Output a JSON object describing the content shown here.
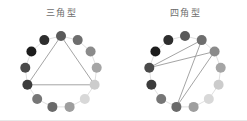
{
  "figure": {
    "background_color": "#ffffff",
    "width": 247,
    "height": 121,
    "bottom_rule_color": "#e8e8e8"
  },
  "panels": [
    {
      "id": "triangle",
      "title": "三角型",
      "title_color": "#6d6d6d"
    },
    {
      "id": "quadrilateral",
      "title": "四角型",
      "title_color": "#6d6d6d"
    }
  ],
  "chart_data": {
    "type": "scatter",
    "title": "",
    "xlabel": "",
    "ylabel": "",
    "grid": false,
    "legend": false,
    "ring_node_count": 13,
    "ring_outline_color": "#e0e0e0",
    "polygon_line_color": "#9a9a9a",
    "node_radius_px": 5.0,
    "ring_radius_px": 36,
    "node_gray_values": [
      "#2c2c2c",
      "#1e1e1e",
      "#3a3a3a",
      "#454545",
      "#4f4f4f",
      "#5c5c5c",
      "#6b6b6b",
      "#7d7d7d",
      "#9a9a9a",
      "#b5b5b5",
      "#cfcfcf",
      "#dcdcdc",
      "#8a8a8a"
    ],
    "panels": [
      {
        "name": "三角型",
        "center": [
          61,
          50
        ],
        "nodes": [
          {
            "index": 0,
            "angle_deg": 90,
            "x": 61.0,
            "y": 14.0,
            "color": "#5a5a5a"
          },
          {
            "index": 1,
            "angle_deg": 62.3,
            "x": 77.7,
            "y": 18.1,
            "color": "#6e6e6e"
          },
          {
            "index": 2,
            "angle_deg": 34.6,
            "x": 90.6,
            "y": 29.5,
            "color": "#8b8b8b"
          },
          {
            "index": 3,
            "angle_deg": 6.9,
            "x": 96.7,
            "y": 45.7,
            "color": "#a5a5a5"
          },
          {
            "index": 4,
            "angle_deg": -20.8,
            "x": 94.6,
            "y": 62.8,
            "color": "#cccccc"
          },
          {
            "index": 5,
            "angle_deg": -48.5,
            "x": 84.8,
            "y": 77.0,
            "color": "#d8d8d8"
          },
          {
            "index": 6,
            "angle_deg": -76.2,
            "x": 69.6,
            "y": 84.9,
            "color": "#9e9e9e"
          },
          {
            "index": 7,
            "angle_deg": -103.8,
            "x": 52.4,
            "y": 84.9,
            "color": "#6a6a6a"
          },
          {
            "index": 8,
            "angle_deg": -131.5,
            "x": 37.2,
            "y": 77.0,
            "color": "#767676"
          },
          {
            "index": 9,
            "angle_deg": -159.2,
            "x": 27.4,
            "y": 62.8,
            "color": "#3c3c3c"
          },
          {
            "index": 10,
            "angle_deg": 173.1,
            "x": 25.3,
            "y": 45.7,
            "color": "#4a4a4a"
          },
          {
            "index": 11,
            "angle_deg": 145.4,
            "x": 31.4,
            "y": 29.5,
            "color": "#1c1c1c"
          },
          {
            "index": 12,
            "angle_deg": 117.7,
            "x": 44.3,
            "y": 18.1,
            "color": "#2e2e2e"
          }
        ],
        "polygon_vertices": [
          0,
          4,
          9
        ],
        "polygon_closed": true,
        "polygon_type": "triangle"
      },
      {
        "name": "四角型",
        "center": [
          61,
          50
        ],
        "nodes": [
          {
            "index": 0,
            "angle_deg": 90,
            "x": 61.0,
            "y": 14.0,
            "color": "#5a5a5a"
          },
          {
            "index": 1,
            "angle_deg": 62.3,
            "x": 77.7,
            "y": 18.1,
            "color": "#6e6e6e"
          },
          {
            "index": 2,
            "angle_deg": 34.6,
            "x": 90.6,
            "y": 29.5,
            "color": "#8b8b8b"
          },
          {
            "index": 3,
            "angle_deg": 6.9,
            "x": 96.7,
            "y": 45.7,
            "color": "#a5a5a5"
          },
          {
            "index": 4,
            "angle_deg": -20.8,
            "x": 94.6,
            "y": 62.8,
            "color": "#cccccc"
          },
          {
            "index": 5,
            "angle_deg": -48.5,
            "x": 84.8,
            "y": 77.0,
            "color": "#d8d8d8"
          },
          {
            "index": 6,
            "angle_deg": -76.2,
            "x": 69.6,
            "y": 84.9,
            "color": "#9e9e9e"
          },
          {
            "index": 7,
            "angle_deg": -103.8,
            "x": 52.4,
            "y": 84.9,
            "color": "#6a6a6a"
          },
          {
            "index": 8,
            "angle_deg": -131.5,
            "x": 37.2,
            "y": 77.0,
            "color": "#767676"
          },
          {
            "index": 9,
            "angle_deg": -159.2,
            "x": 27.4,
            "y": 62.8,
            "color": "#3c3c3c"
          },
          {
            "index": 10,
            "angle_deg": 173.1,
            "x": 25.3,
            "y": 45.7,
            "color": "#4a4a4a"
          },
          {
            "index": 11,
            "angle_deg": 145.4,
            "x": 31.4,
            "y": 29.5,
            "color": "#1c1c1c"
          },
          {
            "index": 12,
            "angle_deg": 117.7,
            "x": 44.3,
            "y": 18.1,
            "color": "#2e2e2e"
          }
        ],
        "polygon_vertices": [
          1,
          7,
          2,
          10
        ],
        "polygon_closed": true,
        "polygon_type": "crossed-quadrilateral"
      }
    ]
  }
}
